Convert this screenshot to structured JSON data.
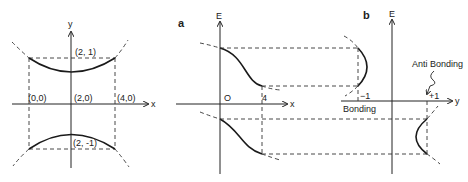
{
  "left_diagram": {
    "x_axis_label": "x",
    "y_axis_label": "y",
    "points": {
      "origin": "(0,0)",
      "center": "(2,0)",
      "right": "(4,0)",
      "top": "(2, 1)",
      "bottom": "(2, -1)"
    }
  },
  "panel_a": {
    "label": "a",
    "vertical_axis_label": "E",
    "horizontal_axis_label": "x",
    "origin_label": "O",
    "tick_label": "4"
  },
  "panel_b": {
    "label": "b",
    "vertical_axis_label": "E",
    "horizontal_axis_label": "y",
    "tick_neg": "−1",
    "tick_pos": "+1",
    "bonding_label": "Bonding",
    "antibonding_label": "Anti Bonding"
  }
}
